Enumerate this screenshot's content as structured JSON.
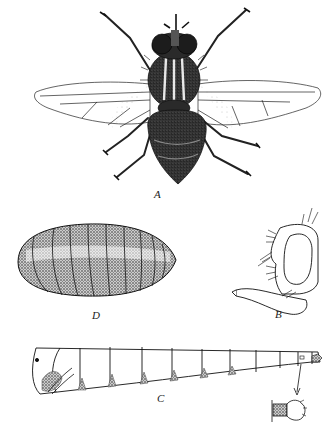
{
  "plate": {
    "background": "#ffffff",
    "ink": "#1a1a1a",
    "figures": [
      {
        "id": "A",
        "label": "A",
        "subject": "adult fly, dorsal view, wings spread"
      },
      {
        "id": "D",
        "label": "D",
        "subject": "puparium, segmented oval"
      },
      {
        "id": "B",
        "label": "B",
        "subject": "head in lateral view with proboscis"
      },
      {
        "id": "C",
        "label": "C",
        "subject": "larva, lateral view"
      },
      {
        "id": "C-detail",
        "label": "",
        "subject": "posterior spiracle detail inset, linked by arrow"
      }
    ]
  },
  "labels": {
    "a": "A",
    "d": "D",
    "b": "B",
    "c": "C"
  }
}
